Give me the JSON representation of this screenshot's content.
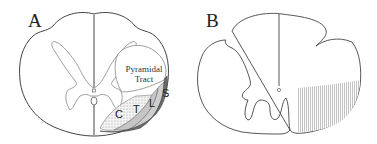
{
  "panels": [
    {
      "label": "A",
      "tract_label": [
        "Pyramidal",
        "Tract"
      ],
      "segments": [
        "C",
        "T",
        "L",
        "S"
      ]
    },
    {
      "label": "B"
    }
  ]
}
